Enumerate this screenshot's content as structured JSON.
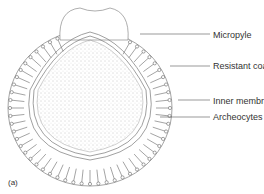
{
  "figure": {
    "panel_label": "(a)",
    "colors": {
      "line": "#555555",
      "fill": "#ffffff",
      "stipple": "#888888"
    }
  },
  "labels": [
    {
      "text": "Micropyle",
      "x": 213,
      "y": 30,
      "line_from_x": 140,
      "line_y": 34
    },
    {
      "text": "Resistant coat",
      "x": 213,
      "y": 61,
      "line_from_x": 170,
      "line_y": 66
    },
    {
      "text": "Inner membrane",
      "x": 213,
      "y": 96,
      "line_from_x": 178,
      "line_y": 100
    },
    {
      "text": "Archeocytes",
      "x": 213,
      "y": 112,
      "line_from_x": 160,
      "line_y": 117
    }
  ]
}
